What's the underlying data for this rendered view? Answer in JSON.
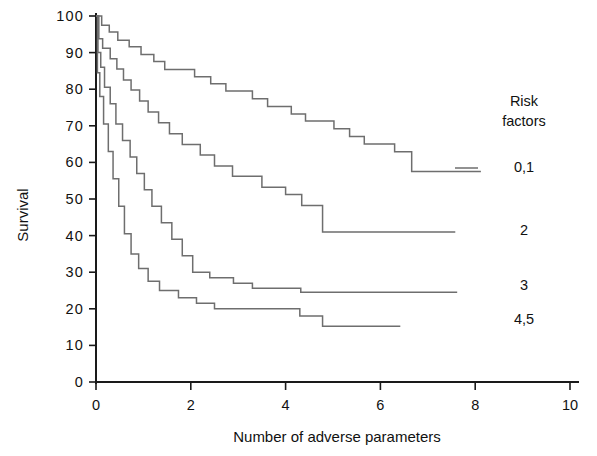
{
  "chart_data": {
    "type": "line",
    "title": "",
    "xlabel": "Number of adverse parameters",
    "ylabel": "Survival",
    "xlim": [
      0,
      10
    ],
    "ylim": [
      0,
      100
    ],
    "xticks": [
      0,
      2,
      4,
      6,
      8,
      10
    ],
    "yticks": [
      0,
      10,
      20,
      30,
      40,
      50,
      60,
      70,
      80,
      90,
      100
    ],
    "grid": false,
    "legend_position": "right",
    "legend_title_lines": [
      "Risk",
      "factors"
    ],
    "line_color": "#6e6e6e",
    "axis_color": "#1a1a1a",
    "series": [
      {
        "name": "0,1",
        "label": "0,1",
        "end_value": 57.5,
        "legend_y": 172,
        "points": [
          [
            0.0,
            100.0
          ],
          [
            0.12,
            100.0
          ],
          [
            0.12,
            97.5
          ],
          [
            0.28,
            97.5
          ],
          [
            0.28,
            95.6
          ],
          [
            0.46,
            95.6
          ],
          [
            0.46,
            93.4
          ],
          [
            0.7,
            93.4
          ],
          [
            0.7,
            91.6
          ],
          [
            0.95,
            91.6
          ],
          [
            0.95,
            89.5
          ],
          [
            1.22,
            89.5
          ],
          [
            1.22,
            87.6
          ],
          [
            1.45,
            87.6
          ],
          [
            1.45,
            85.4
          ],
          [
            2.08,
            85.4
          ],
          [
            2.08,
            83.4
          ],
          [
            2.42,
            83.4
          ],
          [
            2.42,
            81.5
          ],
          [
            2.74,
            81.5
          ],
          [
            2.74,
            79.5
          ],
          [
            3.3,
            79.5
          ],
          [
            3.3,
            77.4
          ],
          [
            3.62,
            77.4
          ],
          [
            3.62,
            75.3
          ],
          [
            4.12,
            75.3
          ],
          [
            4.12,
            73.2
          ],
          [
            4.42,
            73.2
          ],
          [
            4.42,
            71.3
          ],
          [
            5.02,
            71.3
          ],
          [
            5.02,
            69.2
          ],
          [
            5.35,
            69.2
          ],
          [
            5.35,
            67.1
          ],
          [
            5.66,
            67.1
          ],
          [
            5.66,
            65.0
          ],
          [
            6.3,
            65.0
          ],
          [
            6.3,
            62.9
          ],
          [
            6.66,
            62.9
          ],
          [
            6.66,
            57.5
          ],
          [
            8.12,
            57.5
          ]
        ]
      },
      {
        "name": "2",
        "label": "2",
        "end_value": 41.0,
        "legend_y": 235,
        "points": [
          [
            0.0,
            100.0
          ],
          [
            0.06,
            100.0
          ],
          [
            0.06,
            93.8
          ],
          [
            0.14,
            93.8
          ],
          [
            0.14,
            91.2
          ],
          [
            0.3,
            91.2
          ],
          [
            0.3,
            88.3
          ],
          [
            0.44,
            88.3
          ],
          [
            0.44,
            85.5
          ],
          [
            0.58,
            85.5
          ],
          [
            0.58,
            82.5
          ],
          [
            0.74,
            82.5
          ],
          [
            0.74,
            79.8
          ],
          [
            0.92,
            79.8
          ],
          [
            0.92,
            76.8
          ],
          [
            1.1,
            76.8
          ],
          [
            1.1,
            73.8
          ],
          [
            1.32,
            73.8
          ],
          [
            1.32,
            70.8
          ],
          [
            1.55,
            70.8
          ],
          [
            1.55,
            67.8
          ],
          [
            1.82,
            67.8
          ],
          [
            1.82,
            64.9
          ],
          [
            2.2,
            64.9
          ],
          [
            2.2,
            62.0
          ],
          [
            2.5,
            62.0
          ],
          [
            2.5,
            59.0
          ],
          [
            2.88,
            59.0
          ],
          [
            2.88,
            56.2
          ],
          [
            3.5,
            56.2
          ],
          [
            3.5,
            53.2
          ],
          [
            4.0,
            53.2
          ],
          [
            4.0,
            51.2
          ],
          [
            4.34,
            51.2
          ],
          [
            4.34,
            48.2
          ],
          [
            4.78,
            48.2
          ],
          [
            4.78,
            41.0
          ],
          [
            7.58,
            41.0
          ]
        ]
      },
      {
        "name": "3",
        "label": "3",
        "end_value": 24.5,
        "legend_y": 290,
        "points": [
          [
            0.0,
            100.0
          ],
          [
            0.04,
            100.0
          ],
          [
            0.04,
            90.0
          ],
          [
            0.1,
            90.0
          ],
          [
            0.1,
            86.0
          ],
          [
            0.18,
            86.0
          ],
          [
            0.18,
            80.5
          ],
          [
            0.3,
            80.5
          ],
          [
            0.3,
            76.0
          ],
          [
            0.42,
            76.0
          ],
          [
            0.42,
            70.5
          ],
          [
            0.56,
            70.5
          ],
          [
            0.56,
            66.0
          ],
          [
            0.72,
            66.0
          ],
          [
            0.72,
            61.5
          ],
          [
            0.86,
            61.5
          ],
          [
            0.86,
            57.0
          ],
          [
            1.02,
            57.0
          ],
          [
            1.02,
            52.5
          ],
          [
            1.18,
            52.5
          ],
          [
            1.18,
            48.0
          ],
          [
            1.38,
            48.0
          ],
          [
            1.38,
            43.5
          ],
          [
            1.6,
            43.5
          ],
          [
            1.6,
            39.0
          ],
          [
            1.82,
            39.0
          ],
          [
            1.82,
            34.5
          ],
          [
            2.04,
            34.5
          ],
          [
            2.04,
            30.0
          ],
          [
            2.4,
            30.0
          ],
          [
            2.4,
            28.5
          ],
          [
            2.9,
            28.5
          ],
          [
            2.9,
            27.0
          ],
          [
            3.3,
            27.0
          ],
          [
            3.3,
            25.6
          ],
          [
            4.32,
            25.6
          ],
          [
            4.32,
            24.5
          ],
          [
            7.62,
            24.5
          ]
        ]
      },
      {
        "name": "4,5",
        "label": "4,5",
        "end_value": 15.2,
        "legend_y": 324,
        "points": [
          [
            0.0,
            100.0
          ],
          [
            0.03,
            100.0
          ],
          [
            0.03,
            84.5
          ],
          [
            0.08,
            84.5
          ],
          [
            0.08,
            78.0
          ],
          [
            0.16,
            78.0
          ],
          [
            0.16,
            70.5
          ],
          [
            0.26,
            70.5
          ],
          [
            0.26,
            63.0
          ],
          [
            0.36,
            63.0
          ],
          [
            0.36,
            55.5
          ],
          [
            0.48,
            55.5
          ],
          [
            0.48,
            48.0
          ],
          [
            0.6,
            48.0
          ],
          [
            0.6,
            40.5
          ],
          [
            0.74,
            40.5
          ],
          [
            0.74,
            35.0
          ],
          [
            0.9,
            35.0
          ],
          [
            0.9,
            31.0
          ],
          [
            1.1,
            31.0
          ],
          [
            1.1,
            27.5
          ],
          [
            1.34,
            27.5
          ],
          [
            1.34,
            25.0
          ],
          [
            1.74,
            25.0
          ],
          [
            1.74,
            23.0
          ],
          [
            2.12,
            23.0
          ],
          [
            2.12,
            21.5
          ],
          [
            2.5,
            21.5
          ],
          [
            2.5,
            20.0
          ],
          [
            4.3,
            20.0
          ],
          [
            4.3,
            18.0
          ],
          [
            4.78,
            18.0
          ],
          [
            4.78,
            15.2
          ],
          [
            6.42,
            15.2
          ]
        ]
      }
    ]
  },
  "legend": {
    "title_line_1": "Risk",
    "title_line_2": "factors",
    "items": [
      {
        "label": "0,1"
      },
      {
        "label": "2"
      },
      {
        "label": "3"
      },
      {
        "label": "4,5"
      }
    ]
  },
  "axes": {
    "y_title": "Survival",
    "x_title": "Number of adverse parameters",
    "y_tick_labels": [
      "100",
      "90",
      "80",
      "70",
      "60",
      "50",
      "40",
      "30",
      "20",
      "10",
      "0"
    ],
    "x_tick_labels": [
      "0",
      "2",
      "4",
      "6",
      "8",
      "10"
    ]
  }
}
